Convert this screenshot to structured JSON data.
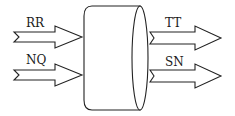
{
  "diagram": {
    "type": "block-flow",
    "center_shape": "cylinder",
    "inputs": [
      {
        "label": "RR"
      },
      {
        "label": "NQ"
      }
    ],
    "outputs": [
      {
        "label": "TT"
      },
      {
        "label": "SN"
      }
    ],
    "colors": {
      "stroke": "#222222",
      "background": "#ffffff"
    }
  }
}
